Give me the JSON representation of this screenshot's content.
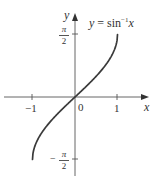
{
  "chart_data": {
    "type": "line",
    "title": "",
    "function_label": {
      "lhs": "y",
      "eq": " = sin",
      "exp": "−1",
      "var": "x"
    },
    "xlabel": "x",
    "ylabel": "y",
    "xlim": [
      -1.2,
      1.4
    ],
    "ylim": [
      -1.9,
      2.1
    ],
    "x_ticks": [
      {
        "value": -1,
        "label": "−1"
      },
      {
        "value": 0,
        "label": "0"
      },
      {
        "value": 1,
        "label": "1"
      }
    ],
    "y_ticks": [
      {
        "value": 1.5708,
        "label_sign": "",
        "label_num": "π",
        "label_den": "2"
      },
      {
        "value": -1.5708,
        "label_sign": "−",
        "label_num": "π",
        "label_den": "2"
      }
    ],
    "grid": false,
    "legend": null,
    "series": [
      {
        "name": "y = sin⁻¹x",
        "x": [
          -1,
          -0.9,
          -0.75,
          -0.5,
          -0.25,
          0,
          0.25,
          0.5,
          0.75,
          0.9,
          1
        ],
        "y": [
          -1.5708,
          -1.1198,
          -0.8481,
          -0.5236,
          -0.2527,
          0,
          0.2527,
          0.5236,
          0.8481,
          1.1198,
          1.5708
        ],
        "color": "#3a3a3a"
      }
    ]
  },
  "colors": {
    "axis": "#555555",
    "curve": "#3a3a3a",
    "text": "#333333"
  }
}
